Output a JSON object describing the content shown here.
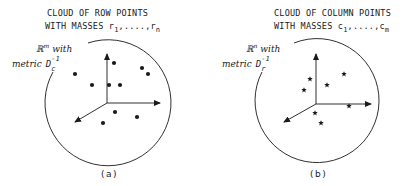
{
  "panels": [
    {
      "id": "a",
      "title_line1": "CLOUD OF ROW POINTS",
      "title_line2_prefix": "WITH MASSES r",
      "title_sub1": "1",
      "title_mid": ",....,r",
      "title_subn": "n",
      "space_symbol": "ℝ",
      "space_exp": "m",
      "space_with": "with",
      "metric_word": "metric",
      "metric_symbol": "D",
      "metric_sub": "c",
      "metric_exp": "-1",
      "point_marker": "dot",
      "label": "(a)"
    },
    {
      "id": "b",
      "title_line1": "CLOUD OF COLUMN POINTS",
      "title_line2_prefix": "WITH MASSES c",
      "title_sub1": "1",
      "title_mid": ",....,c",
      "title_subn": "m",
      "space_symbol": "ℝ",
      "space_exp": "n",
      "space_with": "with",
      "metric_word": "metric",
      "metric_symbol": "D",
      "metric_sub": "r",
      "metric_exp": "-1",
      "point_marker": "star",
      "label": "(b)"
    }
  ],
  "colors": {
    "ink": "#1a1a1a",
    "background": "#ffffff"
  }
}
